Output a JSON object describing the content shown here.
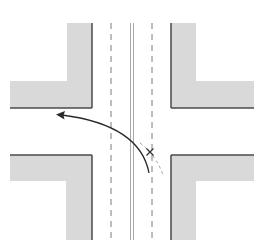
{
  "diagram": {
    "colors": {
      "background": "#ffffff",
      "block_fill": "#d9d9d9",
      "block_edge": "#4a4a4a",
      "lane_line": "#7a7a7a",
      "center_line": "#a8a8a8",
      "turn_path": "#2a2a2a",
      "alt_path": "#a0a0a0",
      "conflict_mark": "#333333"
    },
    "elements": {
      "corner_blocks": [
        "top-left",
        "top-right",
        "bottom-left",
        "bottom-right"
      ],
      "lane_lines": [
        "left-dashed-lane-line",
        "right-dashed-lane-line"
      ],
      "center_line": "double-solid",
      "turn_path": "left-turn-arrow",
      "conflict_marker": "x-mark"
    }
  }
}
